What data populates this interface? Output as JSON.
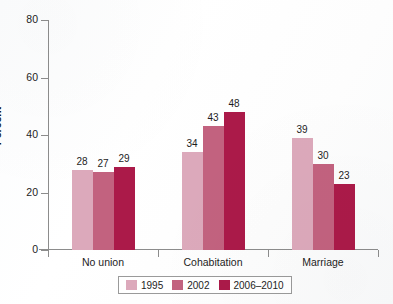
{
  "chart_data": {
    "type": "bar",
    "title": "",
    "xlabel": "",
    "ylabel": "Percent",
    "ylim": [
      0,
      80
    ],
    "yticks": [
      0,
      20,
      40,
      60,
      80
    ],
    "grid": false,
    "legend_position": "bottom",
    "categories": [
      "No union",
      "Cohabitation",
      "Marriage"
    ],
    "series": [
      {
        "name": "1995",
        "color": "#dca9bb",
        "values": [
          28,
          34,
          39
        ]
      },
      {
        "name": "2002",
        "color": "#c2627f",
        "values": [
          27,
          43,
          30
        ]
      },
      {
        "name": "2006–2010",
        "color": "#ab1a49",
        "values": [
          29,
          48,
          23
        ]
      }
    ]
  },
  "axis": {
    "y_title": "Percent",
    "y_tick_labels": [
      "80",
      "60",
      "40",
      "20",
      "0"
    ]
  },
  "legend": {
    "entries": [
      {
        "label": "1995"
      },
      {
        "label": "2002"
      },
      {
        "label": "2006–2010"
      }
    ]
  }
}
